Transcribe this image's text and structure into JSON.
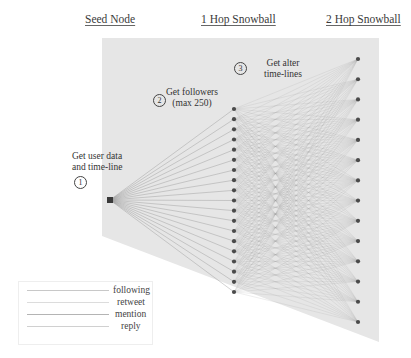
{
  "headers": {
    "seed": "Seed Node",
    "hop1": "1 Hop Snowball",
    "hop2": "2 Hop Snowball"
  },
  "steps": [
    {
      "number": "1",
      "lines": [
        "Get user data",
        "and time-line"
      ]
    },
    {
      "number": "2",
      "lines": [
        "Get followers",
        "(max 250)"
      ]
    },
    {
      "number": "3",
      "lines": [
        "Get alter",
        "time-lines"
      ]
    }
  ],
  "legend": {
    "items": [
      {
        "label": "following",
        "color": "#c8c8c8"
      },
      {
        "label": "retweet",
        "color": "#dcdcdc"
      },
      {
        "label": "mention",
        "color": "#b4b4b4"
      },
      {
        "label": "reply",
        "color": "#d0d0d0"
      }
    ]
  },
  "graph": {
    "panel_color": "#e6e6e6",
    "node_color": "#4a4a4a",
    "edge_color": "#9a9a9a",
    "seed_node": {
      "x": 110,
      "y": 200
    },
    "hop1_nodes": {
      "x": 234,
      "count": 19,
      "y_start": 109,
      "y_end": 292
    },
    "hop2_nodes": {
      "x": 358,
      "count": 14,
      "y_start": 59,
      "y_end": 322
    }
  }
}
